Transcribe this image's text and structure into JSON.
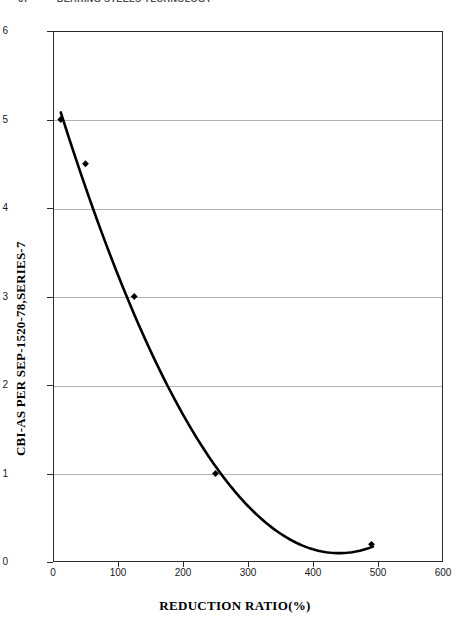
{
  "page_header": {
    "page_number": "67",
    "title": "BEARING STEELS TECHNOLOGY"
  },
  "chart_data": {
    "type": "line",
    "title": "",
    "subtitle": "",
    "xlabel": "REDUCTION RATIO(%)",
    "ylabel": "CBI-AS PER SEP-1520-78,SERIES-7",
    "xlim": [
      0,
      600
    ],
    "ylim": [
      0,
      6
    ],
    "xticks": [
      "0",
      "100",
      "200",
      "300",
      "400",
      "500",
      "600"
    ],
    "xtick_values": [
      0,
      100,
      200,
      300,
      400,
      500,
      600
    ],
    "yticks": [
      "0",
      "1",
      "2",
      "3",
      "4",
      "5",
      "6"
    ],
    "ytick_values": [
      0,
      1,
      2,
      3,
      4,
      5,
      6
    ],
    "grid": "horizontal",
    "legend": "none",
    "series": [
      {
        "name": "CBI vs reduction ratio",
        "marker": "diamond",
        "marker_color": "#000000",
        "line_color": "#000000",
        "x": [
          12,
          50,
          125,
          250,
          490
        ],
        "y": [
          5.0,
          4.5,
          3.0,
          1.0,
          0.2
        ]
      }
    ],
    "fit_curve": {
      "description": "smooth decreasing trend reaching a minimum near x=440, y=0.1 then rising slightly",
      "minimum_x": 440,
      "minimum_y": 0.1
    },
    "annotations": []
  }
}
